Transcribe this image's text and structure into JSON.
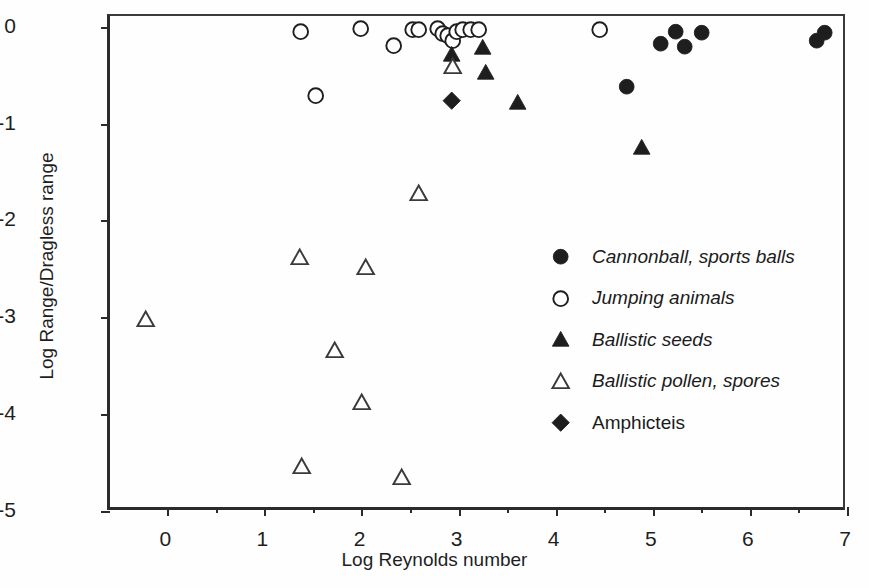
{
  "chart_data": {
    "type": "scatter",
    "title": "",
    "xlabel": "Log Reynolds number",
    "ylabel": "Log Range/Dragless range",
    "xlim": [
      -0.6,
      7.0
    ],
    "ylim": [
      -5.0,
      0.12
    ],
    "xticks": [
      0,
      1,
      2,
      3,
      4,
      5,
      6,
      7
    ],
    "yticks": [
      0,
      -1,
      -2,
      -3,
      -4,
      -5
    ],
    "xtick_labels": [
      "0",
      "1",
      "2",
      "3",
      "4",
      "5",
      "6",
      "7"
    ],
    "ytick_labels": [
      "0",
      "-1",
      "-2",
      "-3",
      "-4",
      "-5"
    ],
    "grid": false,
    "legend_position": "center-right",
    "series": [
      {
        "name": "Cannonball, sports balls",
        "marker": "filled-circle",
        "italic": true,
        "color": "#1e1e1e",
        "points": [
          [
            4.72,
            -0.61
          ],
          [
            5.07,
            -0.17
          ],
          [
            5.23,
            -0.04
          ],
          [
            5.32,
            -0.2
          ],
          [
            5.49,
            -0.05
          ],
          [
            6.68,
            -0.14
          ],
          [
            6.76,
            -0.05
          ]
        ]
      },
      {
        "name": "Jumping animals",
        "marker": "open-circle",
        "italic": true,
        "color": "#1e1e1e",
        "points": [
          [
            1.36,
            -0.04
          ],
          [
            1.52,
            -0.7
          ],
          [
            1.98,
            -0.01
          ],
          [
            2.32,
            -0.19
          ],
          [
            2.52,
            -0.02
          ],
          [
            2.58,
            -0.02
          ],
          [
            2.77,
            -0.01
          ],
          [
            2.83,
            -0.06
          ],
          [
            2.88,
            -0.08
          ],
          [
            2.93,
            -0.14
          ],
          [
            2.97,
            -0.04
          ],
          [
            3.03,
            -0.02
          ],
          [
            3.11,
            -0.02
          ],
          [
            3.2,
            -0.02
          ],
          [
            4.44,
            -0.02
          ]
        ]
      },
      {
        "name": "Ballistic seeds",
        "marker": "filled-triangle",
        "italic": true,
        "color": "#1e1e1e",
        "points": [
          [
            2.92,
            -0.28
          ],
          [
            3.24,
            -0.21
          ],
          [
            3.27,
            -0.47
          ],
          [
            3.6,
            -0.77
          ],
          [
            4.88,
            -1.24
          ]
        ]
      },
      {
        "name": "Ballistic pollen, spores",
        "marker": "open-triangle",
        "italic": true,
        "color": "#3a3a3a",
        "points": [
          [
            -0.23,
            -3.02
          ],
          [
            1.35,
            -2.37
          ],
          [
            1.37,
            -4.53
          ],
          [
            1.71,
            -3.34
          ],
          [
            1.99,
            -3.87
          ],
          [
            2.03,
            -2.48
          ],
          [
            2.4,
            -4.65
          ],
          [
            2.58,
            -1.71
          ],
          [
            2.93,
            -0.4
          ]
        ]
      },
      {
        "name": "Amphicteis",
        "marker": "filled-diamond",
        "italic": false,
        "color": "#1e1e1e",
        "points": [
          [
            2.92,
            -0.75
          ]
        ]
      }
    ]
  },
  "axes": {
    "x_title": "Log Reynolds number",
    "y_title": "Log Range/Dragless range"
  },
  "legend": {
    "entries": [
      {
        "label": "Cannonball, sports balls",
        "marker": "filled-circle"
      },
      {
        "label": "Jumping animals",
        "marker": "open-circle"
      },
      {
        "label": "Ballistic seeds",
        "marker": "filled-triangle"
      },
      {
        "label": "Ballistic pollen, spores",
        "marker": "open-triangle"
      },
      {
        "label": "Amphicteis",
        "marker": "filled-diamond"
      }
    ]
  }
}
